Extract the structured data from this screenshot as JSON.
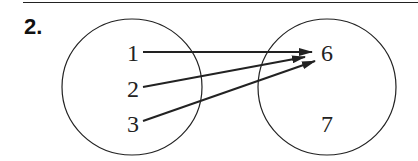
{
  "problem": {
    "number_label": "2."
  },
  "diagram": {
    "type": "mapping-diagram",
    "domain_set": {
      "elements": [
        {
          "label": "1",
          "x": 133,
          "y": 53
        },
        {
          "label": "2",
          "x": 133,
          "y": 89
        },
        {
          "label": "3",
          "x": 133,
          "y": 124
        }
      ],
      "circle": {
        "cx": 132,
        "cy": 87,
        "rx": 70,
        "ry": 68
      }
    },
    "range_set": {
      "elements": [
        {
          "label": "6",
          "x": 327,
          "y": 53
        },
        {
          "label": "7",
          "x": 327,
          "y": 124
        }
      ],
      "circle": {
        "cx": 327,
        "cy": 87,
        "rx": 69,
        "ry": 68
      }
    },
    "mappings": [
      {
        "from": "1",
        "to": "6",
        "x1": 143,
        "y1": 52,
        "x2": 312,
        "y2": 52
      },
      {
        "from": "2",
        "to": "6",
        "x1": 143,
        "y1": 87,
        "x2": 305,
        "y2": 57
      },
      {
        "from": "3",
        "to": "6",
        "x1": 143,
        "y1": 121,
        "x2": 315,
        "y2": 61
      }
    ],
    "stroke_color": "#222222"
  }
}
